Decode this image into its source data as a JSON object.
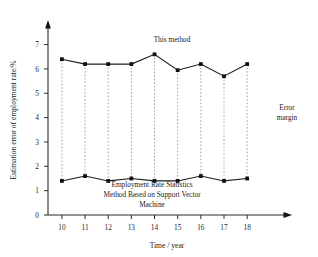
{
  "chart_data": {
    "type": "line",
    "title": "",
    "xlabel": "Time / year",
    "ylabel": "Estimation error of employment rate/%",
    "categories": [
      10,
      11,
      12,
      13,
      14,
      15,
      16,
      17,
      18
    ],
    "xlim": [
      9.4,
      18.9
    ],
    "ylim": [
      0,
      7.6
    ],
    "yticks": [
      0,
      1,
      2,
      3,
      4,
      5,
      6,
      7
    ],
    "xticks": [
      10,
      11,
      12,
      13,
      14,
      15,
      16,
      17,
      18
    ],
    "grid": false,
    "legend_position": "inline-annotations",
    "series": [
      {
        "name": "This method",
        "values": [
          6.4,
          6.2,
          6.2,
          6.2,
          6.6,
          5.95,
          6.2,
          5.7,
          6.2
        ],
        "marker": "square",
        "color": "#111111"
      },
      {
        "name": "Employment Rate Statistics Method Based on Support Vector Machine",
        "values": [
          1.4,
          1.6,
          1.4,
          1.5,
          1.4,
          1.4,
          1.6,
          1.4,
          1.5
        ],
        "marker": "square",
        "color": "#111111"
      }
    ],
    "annotations": [
      {
        "id": "this-method",
        "text": "This method"
      },
      {
        "id": "error-margin-line1",
        "text": "Error"
      },
      {
        "id": "error-margin-line2",
        "text": "margin"
      },
      {
        "id": "svm-caption-line1",
        "text": "Employment Rate Statistics"
      },
      {
        "id": "svm-caption-line2",
        "text": "Method Based on Support Vector"
      },
      {
        "id": "svm-caption-line3",
        "text": "Machine"
      }
    ],
    "connector_style": "dotted-vertical-error-bars",
    "connector_color": "#9a9a9a"
  }
}
